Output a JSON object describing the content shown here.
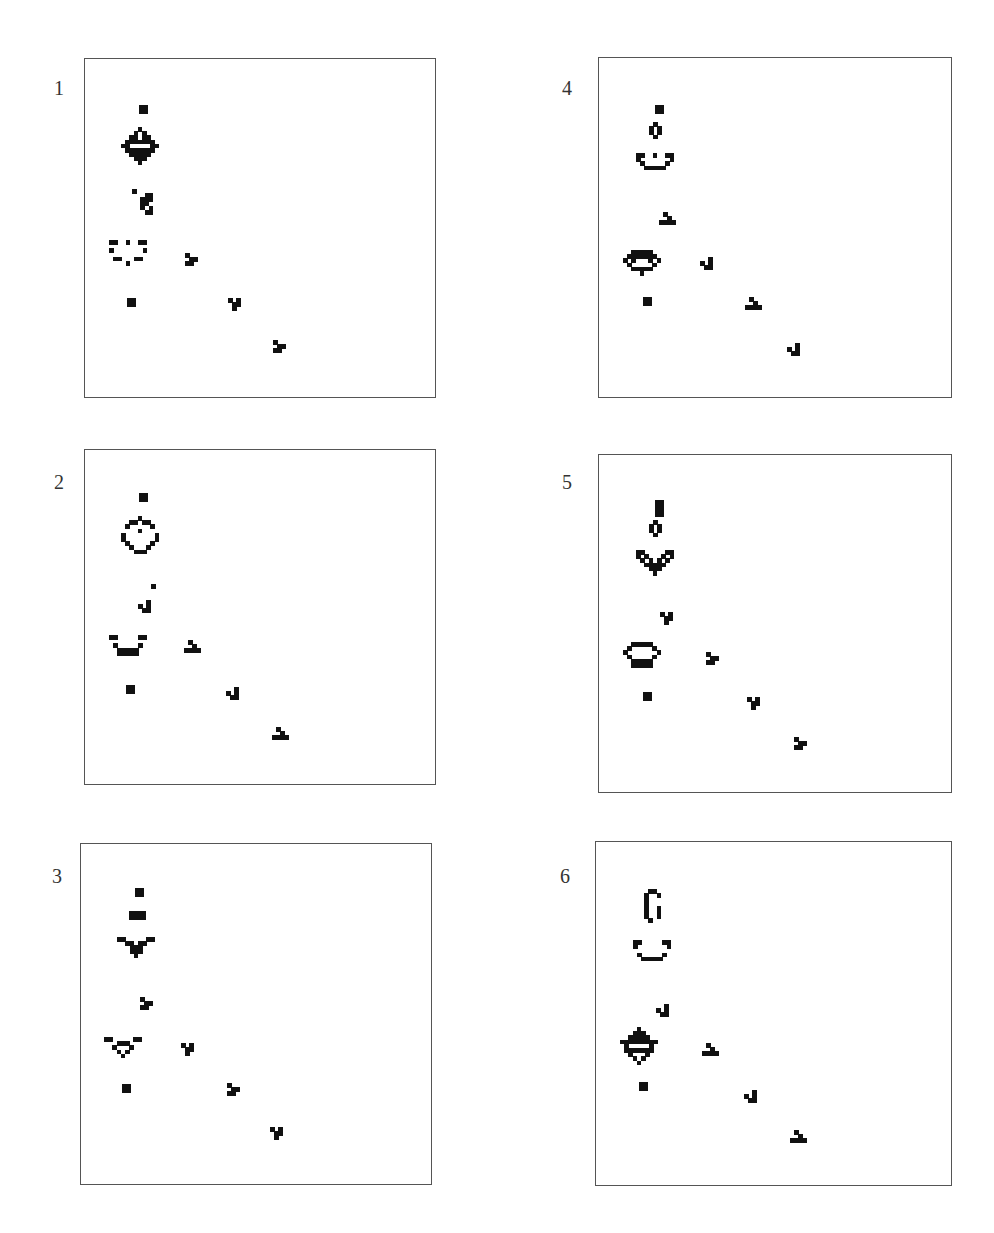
{
  "figure": {
    "cell_size": 4.2,
    "ink_color": "#111111",
    "frame_color": "#555555",
    "panels": [
      {
        "label": "1",
        "label_pos": [
          54,
          78
        ],
        "frame": [
          84,
          58,
          352,
          340
        ],
        "patterns": [
          {
            "name": "block",
            "at": [
              139,
              105
            ],
            "rows": [
              "##",
              "##"
            ]
          },
          {
            "name": "oscillator-large",
            "at": [
              121,
              127
            ],
            "rows": [
              "....#....",
              "...#.#...",
              "..##.##..",
              ".#######.",
              "##.....##",
              ".#######.",
              "..#####..",
              "...###...",
              "....#...."
            ]
          },
          {
            "name": "debris",
            "at": [
              132,
              189
            ],
            "rows": [
              "#....",
              "...##",
              "..###",
              "..##.",
              "..#.#",
              "...##"
            ]
          },
          {
            "name": "ship-open",
            "at": [
              109,
              240
            ],
            "rows": [
              "##..#..##",
              ".........",
              "#.......#",
              ".........",
              ".##...##.",
              "....#...."
            ]
          },
          {
            "name": "block",
            "at": [
              127,
              298
            ],
            "rows": [
              "##",
              "##"
            ]
          },
          {
            "name": "glider",
            "at": [
              185,
              253
            ],
            "rows": [
              "#..",
              ".##",
              "##."
            ]
          },
          {
            "name": "glider",
            "at": [
              228,
              298
            ],
            "rows": [
              "#.#",
              ".##",
              ".#."
            ]
          },
          {
            "name": "glider",
            "at": [
              273,
              340
            ],
            "rows": [
              "#..",
              ".##",
              "##."
            ]
          }
        ]
      },
      {
        "label": "2",
        "label_pos": [
          54,
          472
        ],
        "frame": [
          84,
          449,
          352,
          336
        ],
        "patterns": [
          {
            "name": "block",
            "at": [
              139,
              493
            ],
            "rows": [
              "##",
              "##"
            ]
          },
          {
            "name": "ring",
            "at": [
              121,
              516
            ],
            "rows": [
              "....#....",
              "..##.##..",
              ".#.....#.",
              "....#....",
              "#.......#",
              "#.......#",
              ".#.....#.",
              "..#...#..",
              "...###..."
            ]
          },
          {
            "name": "dot",
            "at": [
              151,
              584
            ],
            "rows": [
              "#"
            ]
          },
          {
            "name": "glider",
            "at": [
              138,
              600
            ],
            "rows": [
              "..#",
              "#.#",
              ".##"
            ]
          },
          {
            "name": "ship-cup",
            "at": [
              109,
              635
            ],
            "rows": [
              "##.....##",
              ".........",
              ".#.....#.",
              "..#####..",
              "..#####.."
            ]
          },
          {
            "name": "block",
            "at": [
              126,
              685
            ],
            "rows": [
              "##",
              "##"
            ]
          },
          {
            "name": "glider",
            "at": [
              184,
              640
            ],
            "rows": [
              ".#..",
              "..#.",
              "####"
            ]
          },
          {
            "name": "glider",
            "at": [
              226,
              687
            ],
            "rows": [
              "..#",
              "#.#",
              ".##"
            ]
          },
          {
            "name": "glider",
            "at": [
              272,
              727
            ],
            "rows": [
              ".#..",
              "..#.",
              "####"
            ]
          }
        ]
      },
      {
        "label": "3",
        "label_pos": [
          52,
          866
        ],
        "frame": [
          80,
          843,
          352,
          342
        ],
        "patterns": [
          {
            "name": "block",
            "at": [
              135,
              888
            ],
            "rows": [
              "##",
              "##"
            ]
          },
          {
            "name": "block-wide",
            "at": [
              129,
              911
            ],
            "rows": [
              "####",
              "####"
            ]
          },
          {
            "name": "spaceship-v",
            "at": [
              117,
              937
            ],
            "rows": [
              "##.....##",
              "..##.##..",
              "...###...",
              "...###...",
              "....#...."
            ]
          },
          {
            "name": "glider",
            "at": [
              140,
              997
            ],
            "rows": [
              "#..",
              ".##",
              "##."
            ]
          },
          {
            "name": "ship-triangle",
            "at": [
              104,
              1037
            ],
            "rows": [
              "##.....##",
              "...###...",
              "..#...#..",
              "...#.#...",
              "....#...."
            ]
          },
          {
            "name": "block",
            "at": [
              122,
              1084
            ],
            "rows": [
              "##",
              "##"
            ]
          },
          {
            "name": "glider",
            "at": [
              181,
              1043
            ],
            "rows": [
              "#.#",
              ".##",
              ".#."
            ]
          },
          {
            "name": "glider",
            "at": [
              227,
              1083
            ],
            "rows": [
              "#..",
              ".##",
              "##."
            ]
          },
          {
            "name": "glider",
            "at": [
              270,
              1127
            ],
            "rows": [
              "#.#",
              ".##",
              ".#."
            ]
          }
        ]
      },
      {
        "label": "4",
        "label_pos": [
          562,
          78
        ],
        "frame": [
          598,
          57,
          354,
          341
        ],
        "patterns": [
          {
            "name": "block",
            "at": [
              655,
              105
            ],
            "rows": [
              "##",
              "##"
            ]
          },
          {
            "name": "beehive-v",
            "at": [
              649,
              122
            ],
            "rows": [
              ".#.",
              "#.#",
              "#.#",
              ".#."
            ]
          },
          {
            "name": "ship-smile",
            "at": [
              636,
              153
            ],
            "rows": [
              "##..#..##",
              "#.......#",
              ".#.....#.",
              "..#####.."
            ]
          },
          {
            "name": "glider",
            "at": [
              659,
              212
            ],
            "rows": [
              ".#..",
              "..#.",
              "####"
            ]
          },
          {
            "name": "ship-saucer",
            "at": [
              623,
              250
            ],
            "rows": [
              "..#####..",
              ".#######.",
              "#.#...#.#",
              ".#.....#.",
              "..#####..",
              "....#...."
            ]
          },
          {
            "name": "block",
            "at": [
              643,
              297
            ],
            "rows": [
              "##",
              "##"
            ]
          },
          {
            "name": "glider",
            "at": [
              700,
              257
            ],
            "rows": [
              "..#",
              "#.#",
              ".##"
            ]
          },
          {
            "name": "glider",
            "at": [
              745,
              297
            ],
            "rows": [
              ".#..",
              "..#.",
              "####"
            ]
          },
          {
            "name": "glider",
            "at": [
              787,
              343
            ],
            "rows": [
              "..#",
              "#.#",
              ".##"
            ]
          }
        ]
      },
      {
        "label": "5",
        "label_pos": [
          562,
          472
        ],
        "frame": [
          598,
          454,
          354,
          339
        ],
        "patterns": [
          {
            "name": "block-tall",
            "at": [
              655,
              500
            ],
            "rows": [
              "##",
              "##",
              "##",
              "##"
            ]
          },
          {
            "name": "beehive-v",
            "at": [
              649,
              520
            ],
            "rows": [
              ".#.",
              "#.#",
              "#.#",
              ".#."
            ]
          },
          {
            "name": "spaceship-heart",
            "at": [
              636,
              550
            ],
            "rows": [
              "##.....##",
              "#.#...#.#",
              ".#.#.#.#.",
              "..#####..",
              "...###...",
              "....#...."
            ]
          },
          {
            "name": "glider",
            "at": [
              660,
              612
            ],
            "rows": [
              "#.#",
              ".##",
              ".#."
            ]
          },
          {
            "name": "ship-egg",
            "at": [
              623,
              642
            ],
            "rows": [
              "..#####..",
              ".#.....#.",
              "#.......#",
              ".#.....#.",
              "..#####..",
              "..#####.."
            ]
          },
          {
            "name": "block",
            "at": [
              643,
              692
            ],
            "rows": [
              "##",
              "##"
            ]
          },
          {
            "name": "glider",
            "at": [
              706,
              652
            ],
            "rows": [
              "#..",
              ".##",
              "##."
            ]
          },
          {
            "name": "glider",
            "at": [
              747,
              697
            ],
            "rows": [
              "#.#",
              ".##",
              ".#."
            ]
          },
          {
            "name": "glider",
            "at": [
              794,
              737
            ],
            "rows": [
              "#..",
              ".##",
              "##."
            ]
          }
        ]
      },
      {
        "label": "6",
        "label_pos": [
          560,
          866
        ],
        "frame": [
          595,
          841,
          357,
          345
        ],
        "patterns": [
          {
            "name": "hook",
            "at": [
              644,
              889
            ],
            "rows": [
              ".##.",
              "#..#",
              "#...",
              "#...",
              "#..#",
              "#..#",
              "#..#",
              ".#.."
            ]
          },
          {
            "name": "ship-smile",
            "at": [
              633,
              940
            ],
            "rows": [
              "##.....##",
              "#.......#",
              "...........",
              ".#.....#.",
              "..#####.."
            ]
          },
          {
            "name": "glider",
            "at": [
              656,
              1004
            ],
            "rows": [
              "..#",
              "#.#",
              ".##"
            ]
          },
          {
            "name": "oscillator-large",
            "at": [
              620,
              1027
            ],
            "rows": [
              "....#....",
              "...###...",
              "..#####..",
              "#########",
              ".#.....#.",
              ".#######.",
              "..#...#..",
              "...#.#...",
              "....#...."
            ]
          },
          {
            "name": "block",
            "at": [
              639,
              1082
            ],
            "rows": [
              "##",
              "##"
            ]
          },
          {
            "name": "glider",
            "at": [
              702,
              1043
            ],
            "rows": [
              ".#..",
              "..#.",
              "####"
            ]
          },
          {
            "name": "glider",
            "at": [
              744,
              1090
            ],
            "rows": [
              "..#",
              "#.#",
              ".##"
            ]
          },
          {
            "name": "glider",
            "at": [
              790,
              1130
            ],
            "rows": [
              ".#..",
              "..#.",
              "####"
            ]
          }
        ]
      }
    ]
  }
}
